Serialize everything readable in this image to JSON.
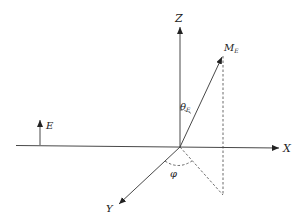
{
  "diagram": {
    "type": "3d-coordinate-system",
    "origin": [
      180,
      147
    ],
    "axes": [
      {
        "id": "x",
        "label": "X",
        "from": [
          16,
          145
        ],
        "to": [
          280,
          148
        ],
        "label_pos": [
          284,
          152
        ]
      },
      {
        "id": "z",
        "label": "Z",
        "from": [
          180,
          147
        ],
        "to": [
          180,
          26
        ],
        "label_pos": [
          176,
          21
        ]
      },
      {
        "id": "y",
        "label": "Y",
        "from": [
          180,
          147
        ],
        "to": [
          118,
          205
        ],
        "label_pos": [
          106,
          212
        ]
      }
    ],
    "vectors": [
      {
        "id": "m_e",
        "label": "M",
        "subscript": "E",
        "from": [
          180,
          147
        ],
        "to": [
          222,
          56
        ],
        "label_pos": [
          224,
          51
        ]
      },
      {
        "id": "e",
        "label": "E",
        "from": [
          40,
          145
        ],
        "to": [
          40,
          119
        ],
        "label_pos": [
          46,
          128
        ]
      }
    ],
    "projections": [
      {
        "id": "vertical-drop",
        "from": [
          223,
          56
        ],
        "to": [
          223,
          195
        ]
      },
      {
        "id": "xy-projection",
        "from": [
          180,
          147
        ],
        "to": [
          223,
          195
        ]
      }
    ],
    "angles": [
      {
        "id": "theta_e",
        "symbol": "θ",
        "subscript": "E",
        "label_pos": [
          186,
          110
        ]
      },
      {
        "id": "phi",
        "symbol": "φ",
        "label_pos": [
          172,
          174
        ]
      }
    ]
  }
}
